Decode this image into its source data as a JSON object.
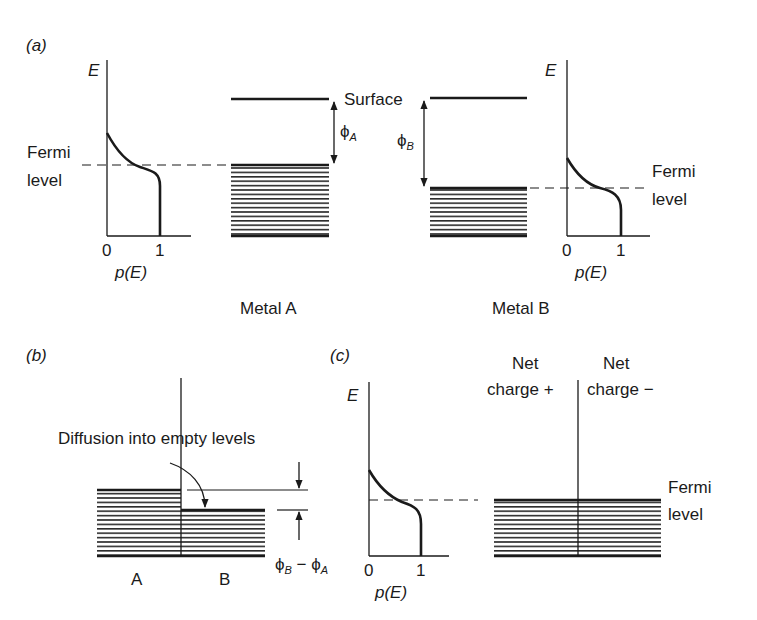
{
  "panel_a": {
    "label": "(a)",
    "left_graph": {
      "y_axis_label": "E",
      "x_axis_label": "p(E)",
      "tick_0": "0",
      "tick_1": "1",
      "fermi_label_line1": "Fermi",
      "fermi_label_line2": "level"
    },
    "surface_label": "Surface",
    "phi_a": {
      "symbol": "ϕ",
      "sub": "A"
    },
    "phi_b": {
      "symbol": "ϕ",
      "sub": "B"
    },
    "right_graph": {
      "y_axis_label": "E",
      "x_axis_label": "p(E)",
      "tick_0": "0",
      "tick_1": "1",
      "fermi_label_line1": "Fermi",
      "fermi_label_line2": "level"
    },
    "metal_a_label": "Metal A",
    "metal_b_label": "Metal B"
  },
  "panel_b": {
    "label": "(b)",
    "diffusion_label": "Diffusion into empty levels",
    "difference_label": {
      "phi": "ϕ",
      "sub_b": "B",
      "minus": " − ",
      "sub_a": "A"
    },
    "side_a": "A",
    "side_b": "B"
  },
  "panel_c": {
    "label": "(c)",
    "y_axis_label": "E",
    "x_axis_label": "p(E)",
    "tick_0": "0",
    "tick_1": "1",
    "net_plus_line1": "Net",
    "net_plus_line2": "charge +",
    "net_minus_line1": "Net",
    "net_minus_line2": "charge −",
    "fermi_label_line1": "Fermi",
    "fermi_label_line2": "level"
  },
  "colors": {
    "ink": "#1a1a1a",
    "background": "#ffffff"
  }
}
